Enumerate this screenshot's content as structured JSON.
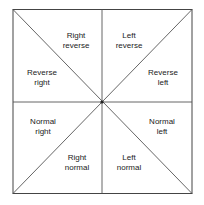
{
  "diagram": {
    "regions": [
      {
        "id": "top-left-upper",
        "line1": "Right",
        "line2": "reverse",
        "x": 61,
        "y": 31
      },
      {
        "id": "top-right-upper",
        "line1": "Left",
        "line2": "reverse",
        "x": 105,
        "y": 31
      },
      {
        "id": "top-left-lower",
        "line1": "Reverse",
        "line2": "right",
        "x": 18,
        "y": 69
      },
      {
        "id": "top-right-lower",
        "line1": "Reverse",
        "line2": "left",
        "x": 143,
        "y": 69
      },
      {
        "id": "bottom-left-upper",
        "line1": "Normal",
        "line2": "right",
        "x": 18,
        "y": 117
      },
      {
        "id": "bottom-right-upper",
        "line1": "Normal",
        "line2": "left",
        "x": 143,
        "y": 117
      },
      {
        "id": "bottom-left-lower",
        "line1": "Right",
        "line2": "normal",
        "x": 61,
        "y": 153
      },
      {
        "id": "bottom-right-lower",
        "line1": "Left",
        "line2": "normal",
        "x": 105,
        "y": 153
      }
    ]
  }
}
